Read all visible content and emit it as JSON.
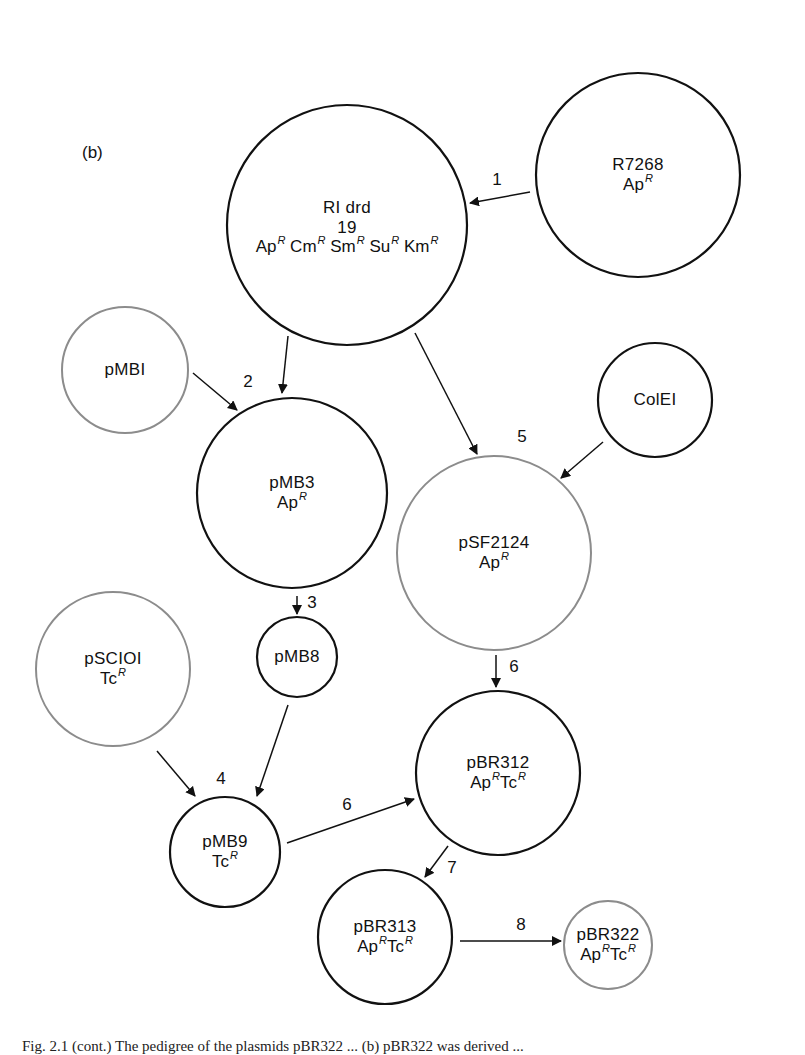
{
  "panel_label": "(b)",
  "colors": {
    "dark_stroke": "#111111",
    "gray_stroke": "#8c8c8c",
    "background": "#ffffff"
  },
  "nodes": [
    {
      "id": "R7268",
      "name": "R7268",
      "resistance": [
        "Ap"
      ],
      "cx": 638,
      "cy": 175,
      "r": 102,
      "stroke": "dark"
    },
    {
      "id": "RIdrd19",
      "name": "RI drd",
      "name2": "19",
      "resistance": [
        "Ap",
        "Cm",
        "Sm",
        "Su",
        "Km"
      ],
      "cx": 347,
      "cy": 225,
      "r": 120,
      "stroke": "dark"
    },
    {
      "id": "pMBI",
      "name": "pMBI",
      "resistance": [],
      "cx": 125,
      "cy": 370,
      "r": 63,
      "stroke": "gray"
    },
    {
      "id": "pMB3",
      "name": "pMB3",
      "resistance": [
        "Ap"
      ],
      "cx": 292,
      "cy": 493,
      "r": 95,
      "stroke": "dark"
    },
    {
      "id": "ColEI",
      "name": "ColEI",
      "resistance": [],
      "cx": 655,
      "cy": 400,
      "r": 57,
      "stroke": "dark"
    },
    {
      "id": "pSF2124",
      "name": "pSF2124",
      "resistance": [
        "Ap"
      ],
      "cx": 494,
      "cy": 553,
      "r": 97,
      "stroke": "gray"
    },
    {
      "id": "pMB8",
      "name": "pMB8",
      "resistance": [],
      "cx": 297,
      "cy": 657,
      "r": 40,
      "stroke": "dark"
    },
    {
      "id": "pSCIOI",
      "name": "pSCIOI",
      "resistance": [
        "Tc"
      ],
      "cx": 113,
      "cy": 669,
      "r": 77,
      "stroke": "gray"
    },
    {
      "id": "pBR312",
      "name": "pBR312",
      "resistance": [
        "Ap",
        "Tc"
      ],
      "cx": 498,
      "cy": 773,
      "r": 82,
      "stroke": "dark"
    },
    {
      "id": "pMB9",
      "name": "pMB9",
      "resistance": [
        "Tc"
      ],
      "cx": 225,
      "cy": 852,
      "r": 55,
      "stroke": "dark"
    },
    {
      "id": "pBR313",
      "name": "pBR313",
      "resistance": [
        "Ap",
        "Tc"
      ],
      "cx": 385,
      "cy": 937,
      "r": 67,
      "stroke": "dark"
    },
    {
      "id": "pBR322",
      "name": "pBR322",
      "resistance": [
        "Ap",
        "Tc"
      ],
      "cx": 608,
      "cy": 945,
      "r": 44,
      "stroke": "gray"
    }
  ],
  "resistance_superscript": "R",
  "arrows": [
    {
      "from": "R7268",
      "to": "RIdrd19",
      "x1": 530,
      "y1": 192,
      "x2": 470,
      "y2": 203
    },
    {
      "from": "RIdrd19",
      "to": "pMB3",
      "x1": 288,
      "y1": 336,
      "x2": 282,
      "y2": 393
    },
    {
      "from": "pMBI",
      "to": "pMB3",
      "x1": 193,
      "y1": 373,
      "x2": 237,
      "y2": 410
    },
    {
      "from": "RIdrd19",
      "to": "pSF2124",
      "x1": 415,
      "y1": 333,
      "x2": 477,
      "y2": 454
    },
    {
      "from": "ColEI",
      "to": "pSF2124",
      "x1": 603,
      "y1": 442,
      "x2": 561,
      "y2": 478
    },
    {
      "from": "pMB3",
      "to": "pMB8",
      "x1": 297,
      "y1": 596,
      "x2": 297,
      "y2": 614
    },
    {
      "from": "pSCIOI",
      "to": "pMB9",
      "x1": 157,
      "y1": 751,
      "x2": 195,
      "y2": 796
    },
    {
      "from": "pMB8",
      "to": "pMB9",
      "x1": 288,
      "y1": 705,
      "x2": 257,
      "y2": 796
    },
    {
      "from": "pSF2124",
      "to": "pBR312",
      "x1": 496,
      "y1": 655,
      "x2": 496,
      "y2": 687
    },
    {
      "from": "pMB9",
      "to": "pBR312",
      "x1": 287,
      "y1": 843,
      "x2": 414,
      "y2": 799
    },
    {
      "from": "pBR312",
      "to": "pBR313",
      "x1": 448,
      "y1": 846,
      "x2": 425,
      "y2": 877
    },
    {
      "from": "pBR313",
      "to": "pBR322",
      "x1": 460,
      "y1": 941,
      "x2": 561,
      "y2": 941
    }
  ],
  "step_labels": [
    {
      "text": "1",
      "x": 497,
      "y": 180
    },
    {
      "text": "2",
      "x": 248,
      "y": 382
    },
    {
      "text": "5",
      "x": 522,
      "y": 437
    },
    {
      "text": "3",
      "x": 312,
      "y": 603
    },
    {
      "text": "6",
      "x": 514,
      "y": 667
    },
    {
      "text": "4",
      "x": 221,
      "y": 779
    },
    {
      "text": "6",
      "x": 347,
      "y": 805
    },
    {
      "text": "7",
      "x": 452,
      "y": 868
    },
    {
      "text": "8",
      "x": 521,
      "y": 925
    }
  ],
  "caption": "Fig. 2.1 (cont.) The pedigree of the plasmids pBR322 ... (b) pBR322 was derived ..."
}
